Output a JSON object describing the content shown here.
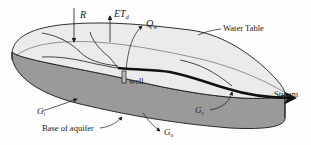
{
  "diagram": {
    "labels": {
      "recharge": "R",
      "evapotranspiration": "ET",
      "evapotranspiration_sub": "d",
      "pumping": "Q",
      "pumping_sub": "w",
      "water_table": "Water Table",
      "well": "well",
      "stream": "Stream",
      "inflow": "G",
      "inflow_sub": "i",
      "stream_exchange": "G",
      "stream_exchange_sub": "s",
      "outflow": "G",
      "outflow_sub": "o",
      "base": "Base of aquifer"
    },
    "colors": {
      "top_surface": "#ebebeb",
      "side_wall": "#9a9a9a",
      "line": "#1a1a1a",
      "stream": "#111111",
      "background": "#fdfdfd"
    }
  }
}
